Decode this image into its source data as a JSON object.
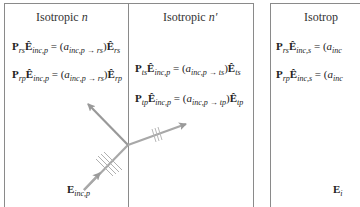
{
  "panels": [
    {
      "id": "p-polarization",
      "regions": [
        {
          "title_prefix": "Isotropic ",
          "title_symbol": "n",
          "equations": [
            {
              "P": "P",
              "P_sub": "rs",
              "E": "Ê",
              "E_sub": "inc,p",
              "eq": " = (",
              "a": "a",
              "a_sub": "inc,p → rs",
              "close": ")",
              "E2": "Ê",
              "E2_sub": "rs"
            },
            {
              "P": "P",
              "P_sub": "rp",
              "E": "Ê",
              "E_sub": "inc,p",
              "eq": " = (",
              "a": "a",
              "a_sub": "inc,p → rs",
              "close": ")",
              "E2": "Ê",
              "E2_sub": "rp"
            }
          ]
        },
        {
          "title_prefix": "Isotropic ",
          "title_symbol": "n′",
          "equations": [
            {
              "P": "P",
              "P_sub": "ts",
              "E": "Ê",
              "E_sub": "inc,p",
              "eq": " = (",
              "a": "a",
              "a_sub": "inc,p → ts",
              "close": ")",
              "E2": "Ê",
              "E2_sub": "ts"
            },
            {
              "P": "P",
              "P_sub": "tp",
              "E": "Ê",
              "E_sub": "inc,p",
              "eq": " = (",
              "a": "a",
              "a_sub": "inc,p → tp",
              "close": ")",
              "E2": "Ê",
              "E2_sub": "tp"
            }
          ]
        }
      ],
      "incident_label": {
        "E": "E",
        "sub": "inc,p"
      }
    },
    {
      "id": "s-polarization-partial",
      "title_visible": "Isotrop",
      "equations": [
        {
          "P": "P",
          "P_sub": "rs",
          "E": "Ê",
          "E_sub": "inc,s",
          "eq": " = (",
          "a": "a",
          "a_sub": "inc"
        },
        {
          "P": "P",
          "P_sub": "rp",
          "E": "Ê",
          "E_sub": "inc,s",
          "eq": " = (",
          "a": "a",
          "a_sub": "inc"
        }
      ],
      "incident_label": {
        "E": "E",
        "sub": "i"
      }
    }
  ],
  "colors": {
    "border": "#8a8a8a",
    "arrow": "#9a9a9a",
    "text": "#222222"
  }
}
